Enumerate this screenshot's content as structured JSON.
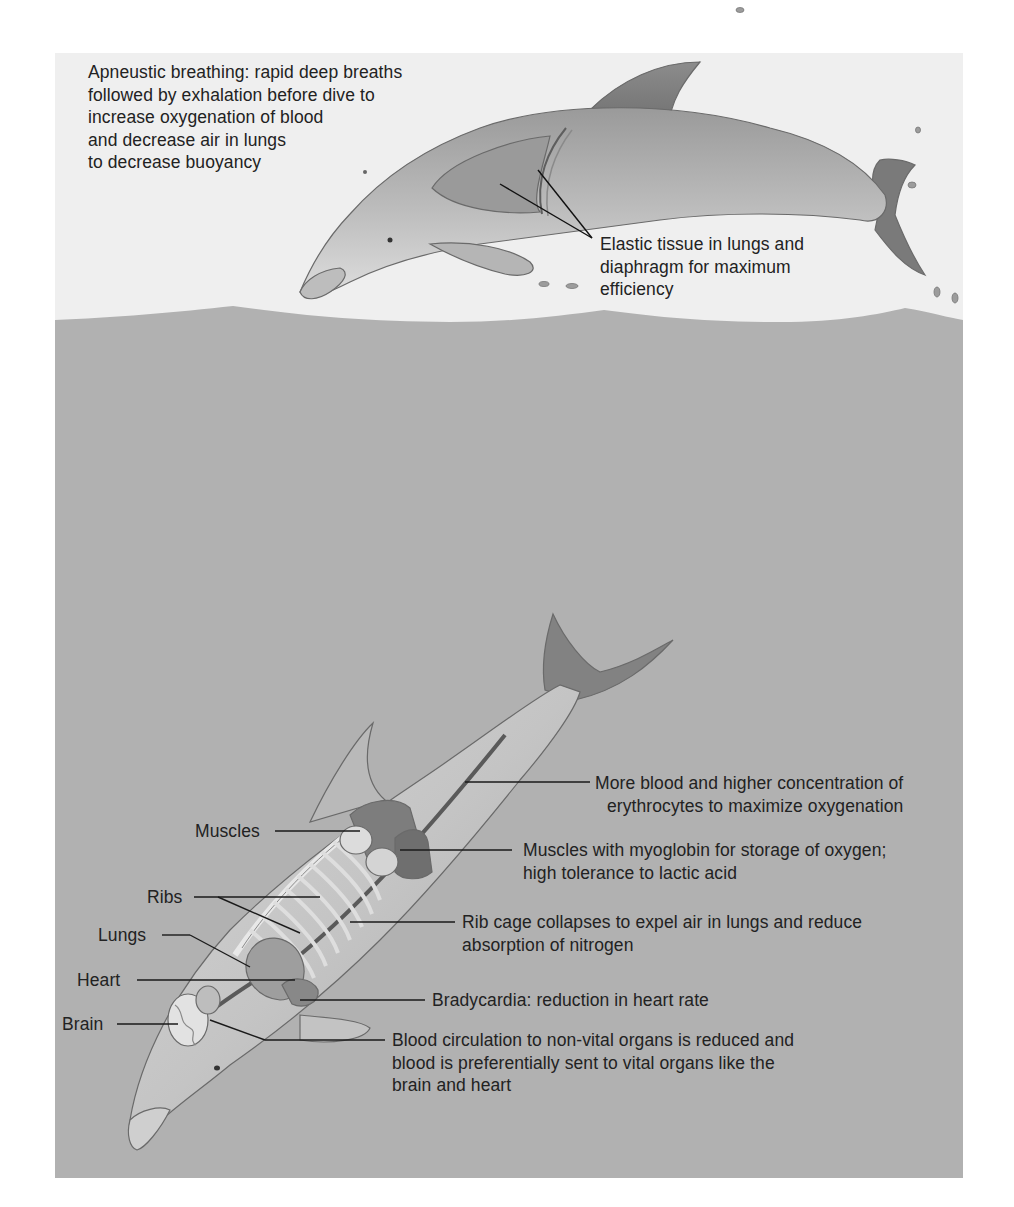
{
  "figure": {
    "colors": {
      "page_background": "#ffffff",
      "sky": "#efefef",
      "water": "#b1b1b1",
      "dolphin_light": "#d2d2d2",
      "dolphin_mid": "#a6a6a6",
      "dolphin_dark": "#7c7c7c",
      "line": "#1a1a1a",
      "text": "#222222"
    },
    "surface_section": {
      "apneustic_breathing": "Apneustic breathing: rapid deep breaths\nfollowed by exhalation before dive to\nincrease oxygenation of blood\nand  decrease air in lungs\nto decrease buoyancy",
      "elastic_tissue": "Elastic tissue in lungs and\ndiaphragm for maximum\nefficiency"
    },
    "underwater_section": {
      "left_labels": {
        "muscles": "Muscles",
        "ribs": "Ribs",
        "lungs": "Lungs",
        "heart": "Heart",
        "brain": "Brain"
      },
      "right_labels": {
        "blood": "More blood and higher concentration of\nerythrocytes to maximize oxygenation",
        "myoglobin": "Muscles with myoglobin for storage of oxygen;\nhigh tolerance to lactic acid",
        "rib_cage": "Rib cage collapses to expel air in lungs and reduce\nabsorption of nitrogen",
        "bradycardia": "Bradycardia: reduction in heart rate",
        "circulation": "Blood circulation to non-vital organs is reduced and\nblood is preferentially sent to vital organs like the\nbrain and heart"
      }
    }
  }
}
